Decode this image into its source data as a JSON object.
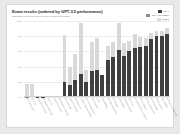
{
  "card": {
    "title": "Exam results (ordered by GPT-3.5 performance)",
    "subtitle": "Estimated percentile lower bound (among test takers)"
  },
  "legend": {
    "position": "top-right",
    "items": [
      {
        "label": "gpt-4",
        "color": "#3f3f3f"
      },
      {
        "label": "gpt-4 (no vision)",
        "color": "#8c8c8c"
      },
      {
        "label": "gpt3.5",
        "color": "#d9d9d9"
      }
    ]
  },
  "axes": {
    "ylabel": "",
    "yticks": [
      "100%",
      "80%",
      "60%",
      "40%",
      "20%",
      "0%"
    ],
    "ylim": [
      0,
      100
    ],
    "grid": true
  },
  "chart_data": {
    "type": "bar",
    "title": "Exam results (ordered by GPT-3.5 performance)",
    "subtitle": "Estimated percentile lower bound (among test takers)",
    "xlabel": "",
    "ylabel": "Estimated percentile lower bound (among test takers)",
    "ylim": [
      0,
      100
    ],
    "grid": true,
    "stacked": true,
    "categories": [
      "AP Calculus BC",
      "AMC 12",
      "Codeforces Rating",
      "AP English Literature",
      "AMC 10",
      "Uniform Bar Exam",
      "AP English Language",
      "AP Chemistry",
      "GRE Quantitative",
      "AP Physics 2",
      "USABO Semifinal 2020",
      "AP Macroeconomics",
      "AP Statistics",
      "LSAT",
      "GRE Writing",
      "AP Microeconomics",
      "AP Biology",
      "GRE Verbal",
      "AP World History",
      "SAT Math",
      "AP Environmental Science",
      "AP US History",
      "AP US Government",
      "AP Psychology",
      "AP Art History",
      "SAT EBRW",
      "AP Human Geography"
    ],
    "series": [
      {
        "name": "gpt3.5",
        "color": "#d9d9d9",
        "values": [
          1,
          4,
          5,
          8,
          10,
          10,
          14,
          22,
          25,
          30,
          31,
          33,
          40,
          40,
          54,
          60,
          62,
          63,
          65,
          70,
          71,
          74,
          77,
          83,
          86,
          87,
          87
        ]
      },
      {
        "name": "gpt-4",
        "color": "#3f3f3f",
        "values": [
          1,
          4,
          5,
          8,
          10,
          10,
          14,
          22,
          25,
          30,
          31,
          33,
          40,
          40,
          54,
          60,
          62,
          63,
          65,
          70,
          71,
          74,
          77,
          83,
          86,
          87,
          87
        ]
      }
    ],
    "bars": [
      {
        "label": "AP Calculus BC",
        "bottom": 1,
        "top": 42
      },
      {
        "label": "AMC 12",
        "bottom": 4,
        "top": 42
      },
      {
        "label": "Codeforces Rating",
        "bottom": 5,
        "top": 5
      },
      {
        "label": "AP English Literature",
        "bottom": 8,
        "top": 8
      },
      {
        "label": "AMC 10",
        "bottom": 10,
        "top": 10
      },
      {
        "label": "Uniform Bar Exam",
        "bottom": 10,
        "top": 10
      },
      {
        "label": "AP English Language",
        "bottom": 14,
        "top": 14
      },
      {
        "label": "AP Chemistry",
        "bottom": 22,
        "top": 90
      },
      {
        "label": "GRE Quantitative",
        "bottom": 25,
        "top": 63
      },
      {
        "label": "AP Physics 2",
        "bottom": 30,
        "top": 75
      },
      {
        "label": "USABO Semifinal 2020",
        "bottom": 31,
        "top": 99
      },
      {
        "label": "AP Macroeconomics",
        "bottom": 33,
        "top": 60
      },
      {
        "label": "AP Statistics",
        "bottom": 40,
        "top": 85
      },
      {
        "label": "LSAT",
        "bottom": 40,
        "top": 88
      },
      {
        "label": "GRE Writing",
        "bottom": 54,
        "top": 54
      },
      {
        "label": "AP Microeconomics",
        "bottom": 60,
        "top": 82
      },
      {
        "label": "AP Biology",
        "bottom": 62,
        "top": 85
      },
      {
        "label": "GRE Verbal",
        "bottom": 63,
        "top": 99
      },
      {
        "label": "AP World History",
        "bottom": 65,
        "top": 84
      },
      {
        "label": "SAT Math",
        "bottom": 70,
        "top": 86
      },
      {
        "label": "AP Environmental Science",
        "bottom": 71,
        "top": 91
      },
      {
        "label": "AP US History",
        "bottom": 74,
        "top": 89
      },
      {
        "label": "AP US Government",
        "bottom": 77,
        "top": 88
      },
      {
        "label": "AP Psychology",
        "bottom": 83,
        "top": 92
      },
      {
        "label": "AP Art History",
        "bottom": 86,
        "top": 93
      },
      {
        "label": "SAT EBRW",
        "bottom": 87,
        "top": 93
      },
      {
        "label": "AP Human Geography",
        "bottom": 87,
        "top": 95
      }
    ]
  }
}
